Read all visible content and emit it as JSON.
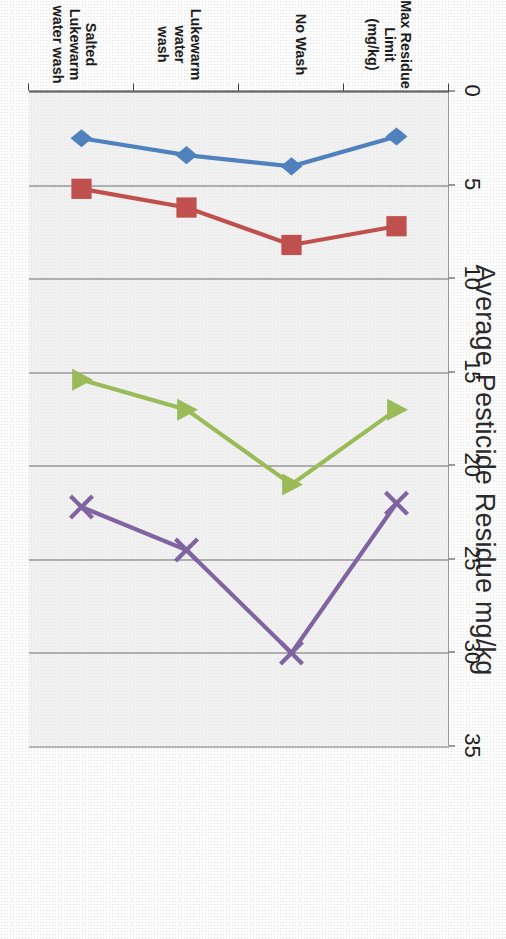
{
  "chart_data": {
    "type": "line",
    "title": "Average Pesticide Residue mg/kg",
    "xlabel": "",
    "ylabel": "",
    "orientation": "rotated-90",
    "grid": true,
    "legend_position": "bottom",
    "categories": [
      "Max Residue Limit\n(mg/kg)",
      "No Wash",
      "Lukewarm water\nwash",
      "Salted  Lukewarm\nwater wash"
    ],
    "value_axis": {
      "min": 0,
      "max": 35,
      "step": 5,
      "ticks": [
        "0",
        "5",
        "10",
        "15",
        "20",
        "25",
        "30",
        "35"
      ]
    },
    "series": [
      {
        "name": "Chloropyrifos",
        "color": "#4F81BD",
        "marker": "diamond",
        "values": [
          2.4,
          4.0,
          3.4,
          2.5
        ]
      },
      {
        "name": "Imazilil",
        "color": "#C0504D",
        "marker": "square",
        "values": [
          7.2,
          8.2,
          6.2,
          5.2
        ]
      },
      {
        "name": "Thiabendazole",
        "color": "#9BBB59",
        "marker": "triangle",
        "values": [
          17.0,
          21.0,
          17.0,
          15.4
        ]
      },
      {
        "name": "Diphenylamine",
        "color": "#8064A2",
        "marker": "cross",
        "values": [
          22.0,
          30.0,
          24.5,
          22.2
        ]
      }
    ]
  }
}
